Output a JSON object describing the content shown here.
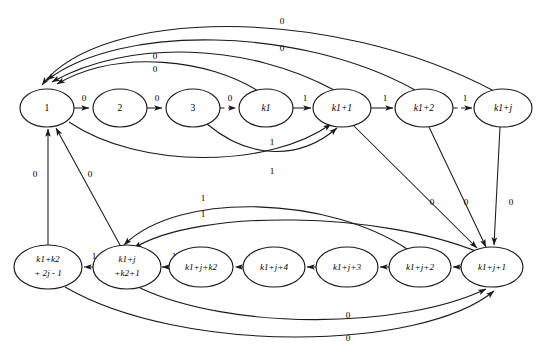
{
  "diagram": {
    "type": "state-transition-diagram",
    "background_color": "#ffffff",
    "stroke_color": "#1a1a1a",
    "nodes": [
      {
        "id": "s1",
        "label": "1",
        "label_lines": [
          "1"
        ],
        "cx": 47,
        "cy": 108,
        "rx": 27,
        "ry": 19,
        "row": "top"
      },
      {
        "id": "s2",
        "label": "2",
        "label_lines": [
          "2"
        ],
        "cx": 120,
        "cy": 108,
        "rx": 27,
        "ry": 19,
        "row": "top"
      },
      {
        "id": "s3",
        "label": "3",
        "label_lines": [
          "3"
        ],
        "cx": 193,
        "cy": 108,
        "rx": 27,
        "ry": 19,
        "row": "top"
      },
      {
        "id": "sk1",
        "label": "k1",
        "label_lines": [
          "k1"
        ],
        "cx": 266,
        "cy": 108,
        "rx": 27,
        "ry": 19,
        "row": "top"
      },
      {
        "id": "sk1p1",
        "label": "k1+1",
        "label_lines": [
          "k1+1"
        ],
        "cx": 342,
        "cy": 108,
        "rx": 29,
        "ry": 19,
        "row": "top"
      },
      {
        "id": "sk1p2",
        "label": "k1+2",
        "label_lines": [
          "k1+2"
        ],
        "cx": 424,
        "cy": 108,
        "rx": 29,
        "ry": 19,
        "row": "top"
      },
      {
        "id": "sk1pj",
        "label": "k1+j",
        "label_lines": [
          "k1+j"
        ],
        "cx": 503,
        "cy": 108,
        "rx": 29,
        "ry": 19,
        "row": "top"
      },
      {
        "id": "bk1k22j1",
        "label": "k1+k2 +2j-1",
        "label_lines": [
          "k1+k2",
          "+ 2j - 1"
        ],
        "cx": 48,
        "cy": 267,
        "rx": 34,
        "ry": 22,
        "row": "bottom"
      },
      {
        "id": "bk1jk2p1",
        "label": "k1+j +k2+1",
        "label_lines": [
          "k1+j",
          "+k2+1"
        ],
        "cx": 127,
        "cy": 267,
        "rx": 34,
        "ry": 22,
        "row": "bottom"
      },
      {
        "id": "bk1jk2",
        "label": "k1+j+k2",
        "label_lines": [
          "k1+j+k2"
        ],
        "cx": 201,
        "cy": 267,
        "rx": 32,
        "ry": 20,
        "row": "bottom"
      },
      {
        "id": "bk1jp4",
        "label": "k1+j+4",
        "label_lines": [
          "k1+j+4"
        ],
        "cx": 274,
        "cy": 267,
        "rx": 31,
        "ry": 20,
        "row": "bottom"
      },
      {
        "id": "bk1jp3",
        "label": "k1+j+3",
        "label_lines": [
          "k1+j+3"
        ],
        "cx": 347,
        "cy": 267,
        "rx": 31,
        "ry": 20,
        "row": "bottom"
      },
      {
        "id": "bk1jp2",
        "label": "k1+j+2",
        "label_lines": [
          "k1+j+2"
        ],
        "cx": 420,
        "cy": 267,
        "rx": 31,
        "ry": 20,
        "row": "bottom"
      },
      {
        "id": "bk1jp1",
        "label": "k1+j+1",
        "label_lines": [
          "k1+j+1"
        ],
        "cx": 492,
        "cy": 267,
        "rx": 31,
        "ry": 20,
        "row": "bottom"
      }
    ],
    "edges": [
      {
        "id": "e1",
        "from": "s1",
        "to": "s2",
        "label": "0",
        "style": "solid",
        "label_x": 84,
        "label_y": 99
      },
      {
        "id": "e2",
        "from": "s2",
        "to": "s3",
        "label": "0",
        "style": "solid",
        "label_x": 157,
        "label_y": 99
      },
      {
        "id": "e3",
        "from": "s3",
        "to": "sk1",
        "label": "0",
        "style": "dashed",
        "label_x": 230,
        "label_y": 99
      },
      {
        "id": "e4",
        "from": "sk1",
        "to": "sk1p1",
        "label": "1",
        "style": "solid",
        "label_x": 305,
        "label_y": 99
      },
      {
        "id": "e5",
        "from": "sk1p1",
        "to": "sk1p2",
        "label": "1",
        "style": "solid",
        "label_x": 385,
        "label_y": 99
      },
      {
        "id": "e6",
        "from": "sk1p2",
        "to": "sk1pj",
        "label": "1",
        "style": "dashed",
        "label_x": 465,
        "label_y": 99
      },
      {
        "id": "e7",
        "from": "sk1p1",
        "to": "s1",
        "label": "0",
        "style": "solid",
        "label_x": 155,
        "label_y": 70
      },
      {
        "id": "e8",
        "from": "sk1p2",
        "to": "s1",
        "label": "0",
        "style": "solid",
        "label_x": 282,
        "label_y": 49
      },
      {
        "id": "e9",
        "from": "sk1pj",
        "to": "s1",
        "label": "0",
        "style": "solid",
        "label_x": 282,
        "label_y": 22
      },
      {
        "id": "e10",
        "from": "sk1",
        "to": "s1",
        "label": "0",
        "style": "solid",
        "label_x": 155,
        "label_y": 57
      },
      {
        "id": "e11",
        "from": "s1",
        "to": "sk1p1",
        "label": "1",
        "style": "solid",
        "label_x": 272,
        "label_y": 143
      },
      {
        "id": "e12",
        "from": "s3",
        "to": "sk1p1",
        "label": "1",
        "style": "solid",
        "label_x": 272,
        "label_y": 172
      },
      {
        "id": "e13",
        "from": "sk1p1",
        "to": "bk1jp1",
        "label": "0",
        "style": "solid",
        "label_x": 432,
        "label_y": 203
      },
      {
        "id": "e14",
        "from": "sk1p2",
        "to": "bk1jp1",
        "label": "0",
        "style": "solid",
        "label_x": 466,
        "label_y": 203
      },
      {
        "id": "e15",
        "from": "sk1pj",
        "to": "bk1jp1",
        "label": "0",
        "style": "solid",
        "label_x": 511,
        "label_y": 203
      },
      {
        "id": "e16",
        "from": "bk1jp1",
        "to": "bk1jp2",
        "label": "",
        "style": "solid",
        "label_x": 0,
        "label_y": 0
      },
      {
        "id": "e17",
        "from": "bk1jp2",
        "to": "bk1jp3",
        "label": "",
        "style": "solid",
        "label_x": 0,
        "label_y": 0
      },
      {
        "id": "e18",
        "from": "bk1jp3",
        "to": "bk1jp4",
        "label": "",
        "style": "solid",
        "label_x": 0,
        "label_y": 0
      },
      {
        "id": "e19",
        "from": "bk1jp4",
        "to": "bk1jk2",
        "label": "",
        "style": "dashed",
        "label_x": 0,
        "label_y": 0
      },
      {
        "id": "e20",
        "from": "bk1jk2",
        "to": "bk1jk2p1",
        "label": "1",
        "style": "solid",
        "label_x": 174,
        "label_y": 257
      },
      {
        "id": "e21",
        "from": "bk1jk2p1",
        "to": "bk1k22j1",
        "label": "1",
        "style": "dashed",
        "label_x": 94,
        "label_y": 257
      },
      {
        "id": "e22",
        "from": "bk1k22j1",
        "to": "s1",
        "label": "0",
        "style": "solid",
        "label_x": 35,
        "label_y": 175
      },
      {
        "id": "e23",
        "from": "bk1jk2p1",
        "to": "s1",
        "label": "0",
        "style": "solid",
        "label_x": 90,
        "label_y": 175
      },
      {
        "id": "e24",
        "from": "bk1jp2",
        "to": "bk1jk2p1",
        "label": "1",
        "style": "solid",
        "label_x": 203,
        "label_y": 199
      },
      {
        "id": "e25",
        "from": "bk1jp1",
        "to": "bk1jk2p1",
        "label": "1",
        "style": "solid",
        "label_x": 203,
        "label_y": 215
      },
      {
        "id": "e26",
        "from": "bk1jk2p1",
        "to": "bk1jp1",
        "label": "0",
        "style": "solid",
        "label_x": 348,
        "label_y": 316
      },
      {
        "id": "e27",
        "from": "bk1k22j1",
        "to": "bk1jp1",
        "label": "0",
        "style": "solid",
        "label_x": 348,
        "label_y": 339
      }
    ],
    "symbols": {
      "zero": "0",
      "one": "1"
    }
  }
}
